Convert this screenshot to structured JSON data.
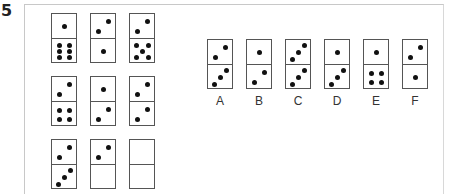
{
  "question_number": "5",
  "grid": {
    "rows": [
      [
        {
          "top": 1,
          "bottom": 6
        },
        {
          "top": 2,
          "bottom": 1
        },
        {
          "top": 2,
          "bottom": 5
        }
      ],
      [
        {
          "top": 2,
          "bottom": 4
        },
        {
          "top": 1,
          "bottom": 2
        },
        {
          "top": 2,
          "bottom": 2
        }
      ],
      [
        {
          "top": 2,
          "bottom": 3
        },
        {
          "top": 2,
          "bottom": 0
        },
        {
          "top": 0,
          "bottom": 0,
          "blank": true
        }
      ]
    ]
  },
  "options": [
    {
      "label": "A",
      "top": 2,
      "bottom": 3
    },
    {
      "label": "B",
      "top": 1,
      "bottom": 2
    },
    {
      "label": "C",
      "top": 3,
      "bottom": 3
    },
    {
      "label": "D",
      "top": 1,
      "bottom": 3
    },
    {
      "label": "E",
      "top": 1,
      "bottom": 4
    },
    {
      "label": "F",
      "top": 2,
      "bottom": 1
    }
  ]
}
